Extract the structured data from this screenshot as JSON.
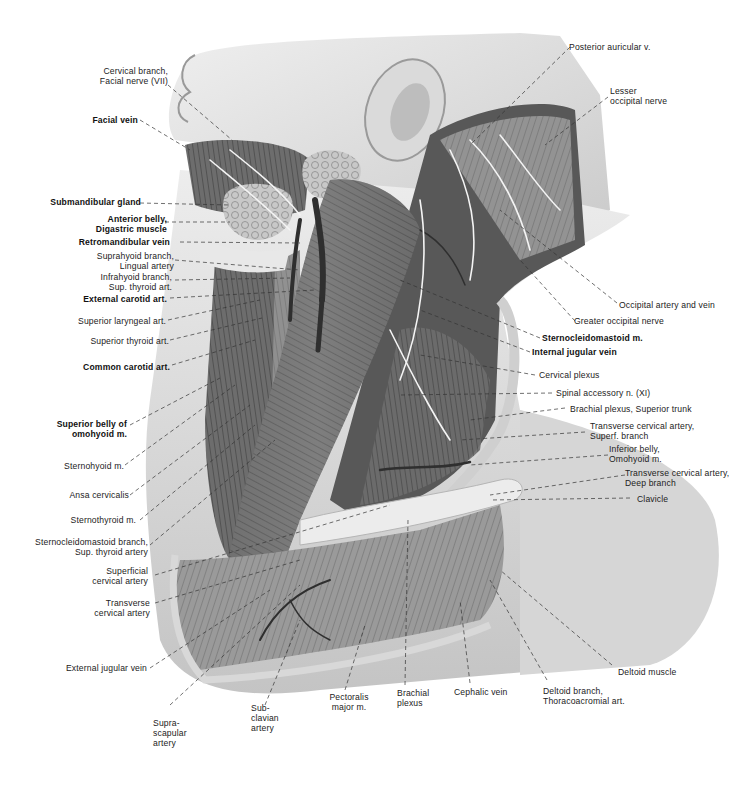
{
  "figure": {
    "colors": {
      "background": "#ffffff",
      "skin": "#e6e6e6",
      "skin_shadow": "#bdbdbd",
      "muscle": "#7a7a7a",
      "muscle_dark": "#4a4a4a",
      "nerve": "#f2f2f2",
      "vessel": "#3a3a3a",
      "leader_line": "#333333",
      "label_text": "#222222"
    }
  },
  "labels": {
    "left": [
      {
        "id": "cervical_branch_facial_nerve",
        "lines": [
          "Cervical branch,",
          "Facial nerve (VII)"
        ],
        "bold": false
      },
      {
        "id": "facial_vein",
        "lines": [
          "Facial vein"
        ],
        "bold": true
      },
      {
        "id": "submandibular_gland",
        "lines": [
          "Submandibular gland"
        ],
        "bold": true
      },
      {
        "id": "anterior_belly_digastric",
        "lines": [
          "Anterior belly,",
          "Digastric muscle"
        ],
        "bold": true
      },
      {
        "id": "retromandibular_vein",
        "lines": [
          "Retromandibular vein"
        ],
        "bold": true
      },
      {
        "id": "suprahyoid_branch",
        "lines": [
          "Suprahyoid branch,",
          "Lingual artery"
        ],
        "bold": false
      },
      {
        "id": "infrahyoid_branch",
        "lines": [
          "Infrahyoid branch,",
          "Sup. thyroid art."
        ],
        "bold": false
      },
      {
        "id": "external_carotid",
        "lines": [
          "External carotid art."
        ],
        "bold": true
      },
      {
        "id": "superior_laryngeal",
        "lines": [
          "Superior laryngeal art."
        ],
        "bold": false
      },
      {
        "id": "superior_thyroid",
        "lines": [
          "Superior thyroid art."
        ],
        "bold": false
      },
      {
        "id": "common_carotid",
        "lines": [
          "Common carotid art."
        ],
        "bold": true
      },
      {
        "id": "superior_belly_omohyoid",
        "lines": [
          "Superior belly of",
          "omohyoid m."
        ],
        "bold": true
      },
      {
        "id": "sternohyoid",
        "lines": [
          "Sternohyoid m."
        ],
        "bold": false
      },
      {
        "id": "ansa_cervicalis",
        "lines": [
          "Ansa cervicalis"
        ],
        "bold": false
      },
      {
        "id": "sternothyroid",
        "lines": [
          "Sternothyroid m."
        ],
        "bold": false
      },
      {
        "id": "scm_branch",
        "lines": [
          "Sternocleidomastoid branch,",
          "Sup. thyroid artery"
        ],
        "bold": false
      },
      {
        "id": "superficial_cervical",
        "lines": [
          "Superficial",
          "cervical artery"
        ],
        "bold": false
      },
      {
        "id": "transverse_cervical",
        "lines": [
          "Transverse",
          "cervical artery"
        ],
        "bold": false
      },
      {
        "id": "external_jugular",
        "lines": [
          "External jugular vein"
        ],
        "bold": false
      }
    ],
    "right": [
      {
        "id": "posterior_auricular",
        "lines": [
          "Posterior auricular v."
        ],
        "bold": false
      },
      {
        "id": "lesser_occipital",
        "lines": [
          "Lesser",
          "occipital nerve"
        ],
        "bold": false
      },
      {
        "id": "occipital_artery_vein",
        "lines": [
          "Occipital artery and vein"
        ],
        "bold": false
      },
      {
        "id": "greater_occipital",
        "lines": [
          "Greater occipital nerve"
        ],
        "bold": false
      },
      {
        "id": "sternocleidomastoid",
        "lines": [
          "Sternocleidomastoid m."
        ],
        "bold": true
      },
      {
        "id": "internal_jugular",
        "lines": [
          "Internal jugular vein"
        ],
        "bold": true
      },
      {
        "id": "cervical_plexus",
        "lines": [
          "Cervical plexus"
        ],
        "bold": false
      },
      {
        "id": "spinal_accessory",
        "lines": [
          "Spinal accessory n. (XI)"
        ],
        "bold": false
      },
      {
        "id": "brachial_superior_trunk",
        "lines": [
          "Brachial plexus, Superior trunk"
        ],
        "bold": false
      },
      {
        "id": "tca_superf",
        "lines": [
          "Transverse cervical artery,",
          "Superf. branch"
        ],
        "bold": false
      },
      {
        "id": "inferior_belly_omohyoid",
        "lines": [
          "Inferior belly,",
          "Omohyoid m."
        ],
        "bold": false
      },
      {
        "id": "tca_deep",
        "lines": [
          "Transverse cervical artery,",
          "Deep branch"
        ],
        "bold": false
      },
      {
        "id": "clavicle",
        "lines": [
          "Clavicle"
        ],
        "bold": false
      },
      {
        "id": "deltoid_muscle",
        "lines": [
          "Deltoid muscle"
        ],
        "bold": false
      }
    ],
    "bottom": [
      {
        "id": "suprascapular",
        "lines": [
          "Supra-",
          "scapular",
          "artery"
        ],
        "bold": false
      },
      {
        "id": "subclavian",
        "lines": [
          "Sub-",
          "clavian",
          "artery"
        ],
        "bold": false
      },
      {
        "id": "pectoralis_major",
        "lines": [
          "Pectoralis",
          "major m."
        ],
        "bold": false
      },
      {
        "id": "brachial_plexus",
        "lines": [
          "Brachial",
          "plexus"
        ],
        "bold": false
      },
      {
        "id": "cephalic_vein",
        "lines": [
          "Cephalic vein"
        ],
        "bold": false
      },
      {
        "id": "deltoid_branch",
        "lines": [
          "Deltoid branch,",
          "Thoracoacromial art."
        ],
        "bold": false
      }
    ]
  }
}
